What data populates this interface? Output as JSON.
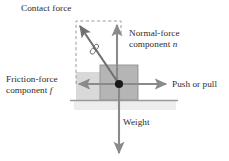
{
  "figure": {
    "type": "physics-force-diagram",
    "background_color": "#ffffff"
  },
  "labels": {
    "contact_force": "Contact force",
    "normal_force_line1": "Normal-force",
    "normal_force_line2_prefix": "component ",
    "normal_force_symbol": "n",
    "friction_force_line1": "Friction-force",
    "friction_force_line2_prefix": "component ",
    "friction_force_symbol": "f",
    "push_or_pull": "Push or pull",
    "weight": "Weight"
  },
  "colors": {
    "arrow_gray": "#8a8a8a",
    "arrow_dark_gray": "#6f6f6f",
    "box_fill": "#b3b3b3",
    "box_stroke": "#8f8f8f",
    "band_fill": "#d6d6d6",
    "ground_line": "#9a9a9a",
    "ground_shadow": "#ebebeb",
    "dashed_line": "#9c9c9c",
    "dot_fill": "#1a1a1a",
    "text": "#2b2b2b"
  },
  "geometry": {
    "origin_point": {
      "x": 119,
      "y": 84
    },
    "box": {
      "x": 100,
      "y": 65,
      "width": 38,
      "height": 35
    },
    "ground_line": {
      "x1": 70,
      "x2": 178,
      "y": 100
    },
    "dashed_rect": {
      "left": 76,
      "top": 21,
      "right": 121,
      "bottom": 84
    }
  },
  "vectors": [
    {
      "name": "contact-force",
      "label": "Contact force",
      "direction": "up-left diagonal",
      "from": {
        "x": 119,
        "y": 84
      },
      "to": {
        "x": 77,
        "y": 23
      },
      "style": "solid-with-hash-mark"
    },
    {
      "name": "normal-force",
      "label": "Normal-force component n",
      "direction": "up",
      "from": {
        "x": 117,
        "y": 84
      },
      "to": {
        "x": 117,
        "y": 22
      },
      "style": "solid"
    },
    {
      "name": "friction-force",
      "label": "Friction-force component f",
      "direction": "left",
      "from": {
        "x": 119,
        "y": 84
      },
      "to": {
        "x": 76,
        "y": 84
      },
      "style": "solid"
    },
    {
      "name": "push-or-pull",
      "label": "Push or pull",
      "direction": "right",
      "from": {
        "x": 119,
        "y": 84
      },
      "to": {
        "x": 169,
        "y": 84
      },
      "style": "solid"
    },
    {
      "name": "weight",
      "label": "Weight",
      "direction": "down",
      "from": {
        "x": 119,
        "y": 84
      },
      "to": {
        "x": 119,
        "y": 156
      },
      "style": "solid"
    }
  ]
}
